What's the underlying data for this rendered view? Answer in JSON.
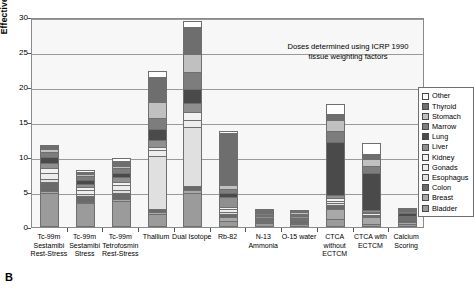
{
  "panel_letter": "B",
  "annotation": {
    "line1": "Doses determined using ICRP 1990",
    "line2": "tissue weighting factors"
  },
  "axes": {
    "ylabel": "Effective Dose (mSv)",
    "yticks": [
      "0",
      "5",
      "10",
      "15",
      "20",
      "25",
      "30"
    ],
    "ymin": 0,
    "ymax": 30
  },
  "legend": {
    "entries": [
      {
        "label": "Other",
        "color": "#ffffff"
      },
      {
        "label": "Thyroid",
        "color": "#6e6e6e"
      },
      {
        "label": "Stomach",
        "color": "#c0c0c0"
      },
      {
        "label": "Marrow",
        "color": "#7d7d7d"
      },
      {
        "label": "Lung",
        "color": "#4a4a4a"
      },
      {
        "label": "Liver",
        "color": "#8f8f8f"
      },
      {
        "label": "Kidney",
        "color": "#f2f2f2"
      },
      {
        "label": "Gonads",
        "color": "#ededed"
      },
      {
        "label": "Esophagus",
        "color": "#e0e0e0"
      },
      {
        "label": "Colon",
        "color": "#6a6a6a"
      },
      {
        "label": "Breast",
        "color": "#a8a8a8"
      },
      {
        "label": "Bladder",
        "color": "#9b9b9b"
      }
    ]
  },
  "chart_data": {
    "type": "bar",
    "subtype": "stacked-bar",
    "title": "",
    "xlabel": "",
    "ylabel": "Effective Dose (mSv)",
    "ylim": [
      0,
      30
    ],
    "grid": true,
    "legend_position": "right",
    "series_order": [
      "Bladder",
      "Breast",
      "Colon",
      "Esophagus",
      "Gonads",
      "Kidney",
      "Liver",
      "Lung",
      "Marrow",
      "Stomach",
      "Thyroid",
      "Other"
    ],
    "categories": [
      "Tc-99m Sestamibi Rest-Stress",
      "Tc-99m Sestamibi Stress",
      "Tc-99m Tetrofosmin Rest-Stress",
      "Thallium",
      "Dual Isotope",
      "Rb-82",
      "N-13 Ammonia",
      "O-15 water",
      "CTCA without ECTCM",
      "CTCA with ECTCM",
      "Calcium Scoring"
    ],
    "category_label_lines": [
      [
        "Tc-99m",
        "Sestamibi",
        "Rest-Stress"
      ],
      [
        "Tc-99m",
        "Sestamibi",
        "Stress"
      ],
      [
        "Tc-99m",
        "Tetrofosmin",
        "Rest-Stress"
      ],
      [
        "Thallium"
      ],
      [
        "Dual Isotope"
      ],
      [
        "Rb-82"
      ],
      [
        "N-13",
        "Ammonia"
      ],
      [
        "O-15 water"
      ],
      [
        "CTCA",
        "without",
        "ECTCM"
      ],
      [
        "CTCA with",
        "ECTCM"
      ],
      [
        "Calcium",
        "Scoring"
      ]
    ],
    "totals": [
      11.5,
      7.9,
      9.6,
      22.0,
      29.2,
      13.4,
      2.2,
      2.1,
      17.3,
      11.8,
      2.2
    ],
    "series": [
      {
        "name": "Bladder",
        "color": "#9b9b9b",
        "values": [
          4.6,
          3.1,
          3.4,
          1.6,
          4.6,
          0.6,
          0.25,
          0.2,
          0.8,
          0.2,
          0.15
        ]
      },
      {
        "name": "Breast",
        "color": "#a8a8a8",
        "values": [
          0.3,
          0.2,
          0.3,
          0.3,
          0.4,
          0.5,
          0.15,
          0.15,
          1.5,
          0.9,
          0.35
        ]
      },
      {
        "name": "Colon",
        "color": "#6a6a6a",
        "values": [
          1.2,
          0.8,
          0.9,
          0.4,
          0.6,
          0.5,
          0.2,
          0.2,
          0.5,
          0.2,
          0.15
        ]
      },
      {
        "name": "Esophagus",
        "color": "#e0e0e0",
        "values": [
          0.5,
          0.3,
          0.4,
          7.6,
          8.4,
          0.3,
          0.15,
          0.15,
          0.4,
          0.2,
          0.1
        ]
      },
      {
        "name": "Gonads",
        "color": "#ededed",
        "values": [
          0.9,
          0.6,
          0.7,
          0.8,
          1.0,
          0.4,
          0.15,
          0.15,
          0.3,
          0.2,
          0.1
        ]
      },
      {
        "name": "Kidney",
        "color": "#f2f2f2",
        "values": [
          0.6,
          0.4,
          0.5,
          0.5,
          1.1,
          0.3,
          0.15,
          0.15,
          0.3,
          0.2,
          0.1
        ]
      },
      {
        "name": "Liver",
        "color": "#8f8f8f",
        "values": [
          0.7,
          0.5,
          0.6,
          1.0,
          1.3,
          1.4,
          0.25,
          0.25,
          0.5,
          0.3,
          0.15
        ]
      },
      {
        "name": "Lung",
        "color": "#4a4a4a",
        "values": [
          0.9,
          0.6,
          0.7,
          1.5,
          2.1,
          0.6,
          0.2,
          0.2,
          7.6,
          5.2,
          0.5
        ]
      },
      {
        "name": "Marrow",
        "color": "#7d7d7d",
        "values": [
          0.8,
          0.5,
          0.6,
          1.6,
          2.3,
          0.6,
          0.2,
          0.2,
          1.5,
          1.0,
          0.25
        ]
      },
      {
        "name": "Stomach",
        "color": "#c0c0c0",
        "values": [
          0.4,
          0.3,
          0.4,
          2.3,
          2.6,
          0.5,
          0.2,
          0.2,
          1.6,
          1.1,
          0.2
        ]
      },
      {
        "name": "Thyroid",
        "color": "#6e6e6e",
        "values": [
          0.4,
          0.3,
          0.6,
          3.5,
          3.9,
          7.5,
          0.2,
          0.2,
          0.9,
          0.6,
          0.1
        ]
      },
      {
        "name": "Other",
        "color": "#ffffff",
        "values": [
          0.2,
          0.3,
          0.5,
          0.9,
          0.9,
          0.2,
          0.1,
          0.1,
          1.4,
          1.7,
          0.05
        ]
      }
    ]
  }
}
